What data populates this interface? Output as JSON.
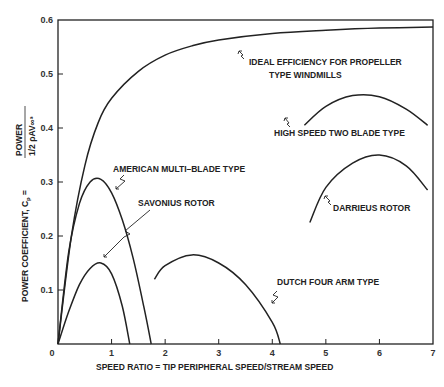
{
  "chart_data": {
    "type": "line",
    "title": "",
    "xlabel": "SPEED RATIO = TIP PERIPHERAL SPEED/STREAM SPEED",
    "ylabel": "POWER COEFFICIENT, C",
    "ylabel_sub": "p",
    "ylabel_formula_num": "POWER",
    "ylabel_formula_den": "1/2 ρAV∞³",
    "xlim": [
      0,
      7
    ],
    "ylim": [
      0,
      0.6
    ],
    "xticks": [
      "0",
      "1",
      "2",
      "3",
      "4",
      "5",
      "6",
      "7"
    ],
    "yticks": [
      "0",
      "0.1",
      "0.2",
      "0.3",
      "0.4",
      "0.5",
      "0.6"
    ],
    "grid": false,
    "series": [
      {
        "name": "IDEAL EFFICIENCY FOR PROPELLER TYPE WINDMILLS",
        "x": [
          0,
          0.25,
          0.5,
          0.75,
          1.0,
          1.5,
          2.0,
          2.5,
          3.0,
          4.0,
          5.0,
          6.0,
          7.0
        ],
        "y": [
          0,
          0.2,
          0.33,
          0.41,
          0.455,
          0.505,
          0.535,
          0.552,
          0.563,
          0.575,
          0.581,
          0.585,
          0.587
        ]
      },
      {
        "name": "HIGH SPEED TWO BLADE TYPE",
        "x": [
          4.6,
          5.0,
          5.5,
          6.0,
          6.5,
          6.9
        ],
        "y": [
          0.405,
          0.44,
          0.46,
          0.458,
          0.435,
          0.405
        ]
      },
      {
        "name": "AMERICAN MULTI-BLADE TYPE",
        "x": [
          0,
          0.2,
          0.4,
          0.6,
          0.8,
          1.0,
          1.2,
          1.4,
          1.6,
          1.74
        ],
        "y": [
          0,
          0.17,
          0.26,
          0.3,
          0.305,
          0.28,
          0.23,
          0.16,
          0.07,
          0
        ]
      },
      {
        "name": "SAVONIUS ROTOR",
        "x": [
          0,
          0.2,
          0.4,
          0.6,
          0.8,
          1.0,
          1.2,
          1.34
        ],
        "y": [
          0,
          0.06,
          0.11,
          0.14,
          0.15,
          0.13,
          0.07,
          0
        ]
      },
      {
        "name": "DARRIEUS ROTOR",
        "x": [
          4.7,
          5.0,
          5.5,
          6.0,
          6.5,
          6.9
        ],
        "y": [
          0.225,
          0.29,
          0.335,
          0.35,
          0.33,
          0.285
        ]
      },
      {
        "name": "DUTCH FOUR ARM TYPE",
        "x": [
          1.8,
          2.0,
          2.5,
          3.0,
          3.5,
          4.0,
          4.15
        ],
        "y": [
          0.12,
          0.145,
          0.165,
          0.15,
          0.11,
          0.04,
          0
        ]
      }
    ],
    "annotations": [
      {
        "key": "ideal_1",
        "text": "IDEAL EFFICIENCY FOR PROPELLER"
      },
      {
        "key": "ideal_2",
        "text": "TYPE WINDMILLS"
      },
      {
        "key": "high",
        "text": "HIGH SPEED TWO BLADE TYPE"
      },
      {
        "key": "american",
        "text": "AMERICAN MULTI–BLADE TYPE"
      },
      {
        "key": "savonius",
        "text": "SAVONIUS ROTOR"
      },
      {
        "key": "darrieus",
        "text": "DARRIEUS ROTOR"
      },
      {
        "key": "dutch",
        "text": "DUTCH FOUR ARM TYPE"
      }
    ]
  }
}
